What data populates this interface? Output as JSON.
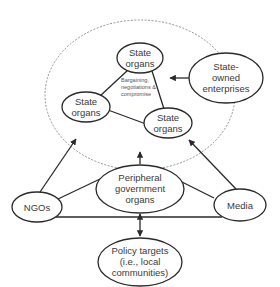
{
  "diagram": {
    "title": "",
    "colors": {
      "stroke": "#2a2a2a",
      "text": "#3a3a3a",
      "dashed_boundary": "#777777",
      "background": "#ffffff"
    },
    "boundary": {
      "style": "dashed-ellipse",
      "meaning": "central state arena"
    },
    "nodes": {
      "state_top": {
        "lines": [
          "State",
          "organs"
        ]
      },
      "state_left": {
        "lines": [
          "State",
          "organs"
        ]
      },
      "state_right": {
        "lines": [
          "State",
          "organs"
        ]
      },
      "soe": {
        "lines": [
          "State-",
          "owned",
          "enterprises"
        ]
      },
      "peripheral": {
        "lines": [
          "Peripheral",
          "government",
          "organs"
        ]
      },
      "ngos": {
        "lines": [
          "NGOs"
        ]
      },
      "media": {
        "lines": [
          "Media"
        ]
      },
      "policy": {
        "lines": [
          "Policy targets",
          "(i.e., local",
          "communities)"
        ]
      }
    },
    "center_note": {
      "lines": [
        "Bargaining,",
        "negotiations &",
        "compromise"
      ]
    },
    "edges": [
      {
        "from": "state_top",
        "to": "state_left",
        "type": "line"
      },
      {
        "from": "state_top",
        "to": "state_right",
        "type": "line"
      },
      {
        "from": "state_left",
        "to": "state_right",
        "type": "line"
      },
      {
        "from": "soe",
        "to": "state_arena",
        "type": "arrow"
      },
      {
        "from": "peripheral",
        "to": "state_arena",
        "type": "arrow"
      },
      {
        "from": "ngos",
        "to": "state_arena",
        "type": "arrow"
      },
      {
        "from": "media",
        "to": "state_arena",
        "type": "arrow"
      },
      {
        "from": "ngos",
        "to": "peripheral",
        "type": "line"
      },
      {
        "from": "media",
        "to": "peripheral",
        "type": "line"
      },
      {
        "from": "ngos",
        "to": "media",
        "type": "line"
      },
      {
        "from": "peripheral",
        "to": "policy",
        "type": "double-arrow"
      }
    ]
  }
}
